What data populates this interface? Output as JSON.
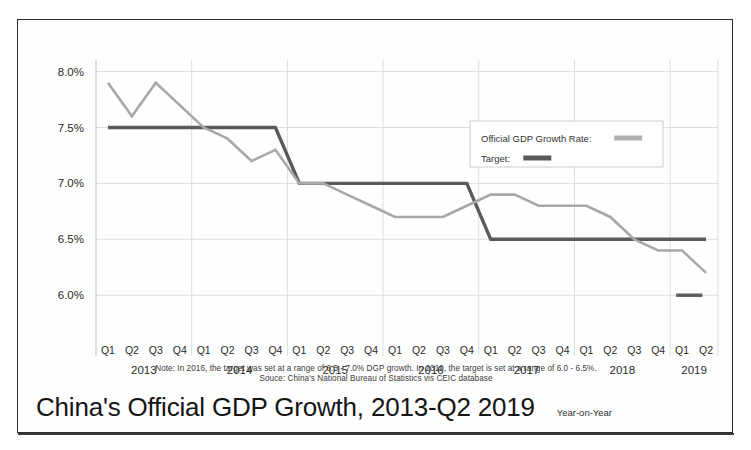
{
  "chart_data": {
    "type": "line",
    "title": "China's Official GDP Growth, 2013-Q2 2019",
    "subtitle": "Year-on-Year",
    "xlabel": "",
    "ylabel": "",
    "ylim": [
      5.85,
      8.05
    ],
    "grid": true,
    "legend_position": "top-right",
    "y_ticks": [
      "8.0%",
      "7.5%",
      "7.0%",
      "6.5%",
      "6.0%"
    ],
    "y_tick_values": [
      8.0,
      7.5,
      7.0,
      6.5,
      6.0
    ],
    "x": [
      "Q1 2013",
      "Q2 2013",
      "Q3 2013",
      "Q4 2013",
      "Q1 2014",
      "Q2 2014",
      "Q3 2014",
      "Q4 2014",
      "Q1 2015",
      "Q2 2015",
      "Q3 2015",
      "Q4 2015",
      "Q1 2016",
      "Q2 2016",
      "Q3 2016",
      "Q4 2016",
      "Q1 2017",
      "Q2 2017",
      "Q3 2017",
      "Q4 2017",
      "Q1 2018",
      "Q2 2018",
      "Q3 2018",
      "Q4 2018",
      "Q1 2019",
      "Q2 2019"
    ],
    "quarter_labels": [
      "Q1",
      "Q2",
      "Q3",
      "Q4",
      "Q1",
      "Q2",
      "Q3",
      "Q4",
      "Q1",
      "Q2",
      "Q3",
      "Q4",
      "Q1",
      "Q2",
      "Q3",
      "Q4",
      "Q1",
      "Q2",
      "Q3",
      "Q4",
      "Q1",
      "Q2",
      "Q3",
      "Q4",
      "Q1",
      "Q2"
    ],
    "year_groups": [
      {
        "year": "2013",
        "start_index": 0,
        "count": 4
      },
      {
        "year": "2014",
        "start_index": 4,
        "count": 4
      },
      {
        "year": "2015",
        "start_index": 8,
        "count": 4
      },
      {
        "year": "2016",
        "start_index": 12,
        "count": 4
      },
      {
        "year": "2017",
        "start_index": 16,
        "count": 4
      },
      {
        "year": "2018",
        "start_index": 20,
        "count": 4
      },
      {
        "year": "2019",
        "start_index": 24,
        "count": 2
      }
    ],
    "series": [
      {
        "name": "Official GDP Growth Rate",
        "color": "#a8a8a8",
        "width": 2.6,
        "values": [
          7.9,
          7.6,
          7.9,
          7.7,
          7.5,
          7.4,
          7.2,
          7.3,
          7.0,
          7.0,
          6.9,
          6.8,
          6.7,
          6.7,
          6.7,
          6.8,
          6.9,
          6.9,
          6.8,
          6.8,
          6.8,
          6.7,
          6.5,
          6.4,
          6.4,
          6.2
        ]
      },
      {
        "name": "Target",
        "color": "#5a5a5a",
        "width": 3.4,
        "values": [
          7.5,
          7.5,
          7.5,
          7.5,
          7.5,
          7.5,
          7.5,
          7.5,
          7.0,
          7.0,
          7.0,
          7.0,
          7.0,
          7.0,
          7.0,
          7.0,
          6.5,
          6.5,
          6.5,
          6.5,
          6.5,
          6.5,
          6.5,
          6.5,
          6.5,
          6.5
        ]
      }
    ],
    "target_lower_band": {
      "name": "2019 target lower bound",
      "color": "#5a5a5a",
      "value": 6.0,
      "start_index": 24,
      "end_index": 25
    },
    "annotations": [
      "Note: In 2016, the target was set at a range of 6.5 - 7.0% DGP growth. In 2019, the target is set at a range of 6.0 - 6.5%.",
      "Souce: China's National Bureau of Statistics vis CEIC database"
    ]
  },
  "legend": {
    "items": [
      {
        "label": "Official GDP Growth Rate",
        "color": "#b0b0b0"
      },
      {
        "label": "Target",
        "color": "#595959"
      }
    ]
  },
  "footer": {
    "note": "Note: In 2016, the target was set at a range of 6.5 - 7.0% DGP growth. In 2019, the target is set at a range of 6.0 - 6.5%.",
    "source": "Souce: China's National Bureau of Statistics vis CEIC database"
  },
  "title": {
    "main": "China's Official GDP Growth, 2013-Q2 2019",
    "sub": "Year-on-Year"
  },
  "colors": {
    "frame": "#2b2b2b",
    "grid": "#d9d9d9",
    "axis": "#bdbdbd",
    "series_actual": "#a8a8a8",
    "series_target": "#5a5a5a",
    "text": "#1a1a1a"
  }
}
